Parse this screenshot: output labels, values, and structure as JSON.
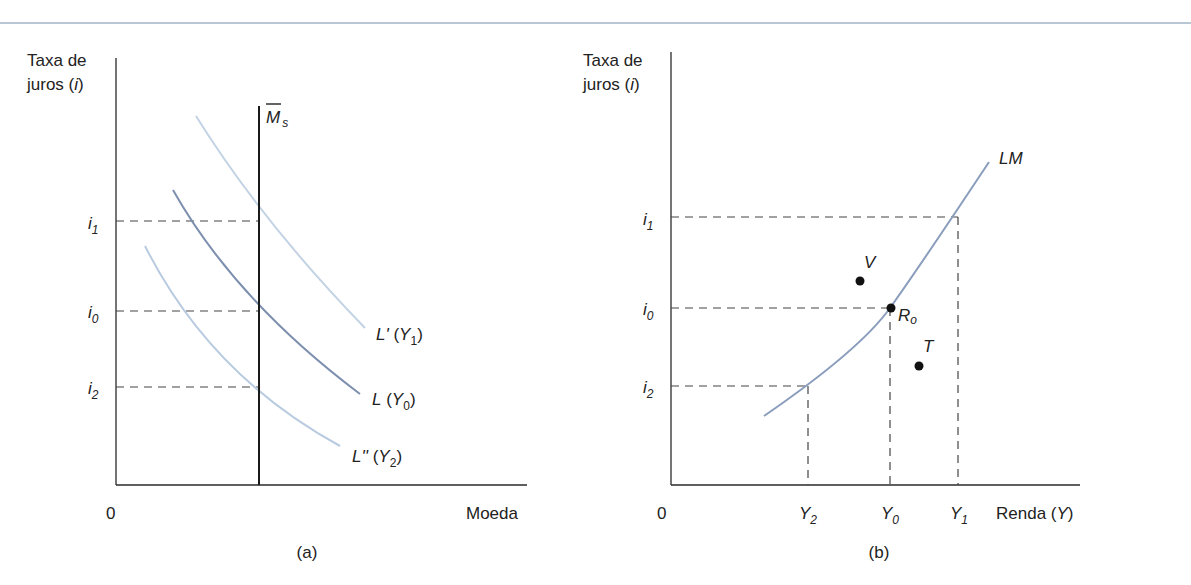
{
  "figure": {
    "panel_a": {
      "caption": "(a)",
      "y_axis_label_line1": "Taxa de",
      "y_axis_label_line2_text": "juros (",
      "y_axis_label_line2_var": "i",
      "y_axis_label_line2_close": ")",
      "origin": "0",
      "x_axis_label": "Moeda",
      "ticks_y": [
        {
          "base": "i",
          "sub": "1"
        },
        {
          "base": "i",
          "sub": "0"
        },
        {
          "base": "i",
          "sub": "2"
        }
      ],
      "money_supply_label": {
        "base": "M",
        "sub": "s"
      },
      "curves": [
        {
          "name": "L'",
          "arg_base": "Y",
          "arg_sub": "1"
        },
        {
          "name": "L",
          "arg_base": "Y",
          "arg_sub": "0"
        },
        {
          "name": "L''",
          "arg_base": "Y",
          "arg_sub": "2"
        }
      ]
    },
    "panel_b": {
      "caption": "(b)",
      "y_axis_label_line1": "Taxa de",
      "y_axis_label_line2_text": "juros (",
      "y_axis_label_line2_var": "i",
      "y_axis_label_line2_close": ")",
      "origin": "0",
      "x_axis_label_text": "Renda (",
      "x_axis_label_var": "Y",
      "x_axis_label_close": ")",
      "ticks_y": [
        {
          "base": "i",
          "sub": "1"
        },
        {
          "base": "i",
          "sub": "0"
        },
        {
          "base": "i",
          "sub": "2"
        }
      ],
      "ticks_x": [
        {
          "base": "Y",
          "sub": "2"
        },
        {
          "base": "Y",
          "sub": "0"
        },
        {
          "base": "Y",
          "sub": "1"
        }
      ],
      "curve_label": "LM",
      "points": [
        {
          "label": "V"
        },
        {
          "label": "R",
          "sub": "o"
        },
        {
          "label": "T"
        }
      ]
    },
    "colors": {
      "axis": "#2a2a2a",
      "curve_dark": "#7d8fae",
      "curve_light": "#b9cbe0",
      "lm_curve": "#8a9dbd",
      "dash": "#444444",
      "top_rule": "#b9c6d3"
    }
  }
}
